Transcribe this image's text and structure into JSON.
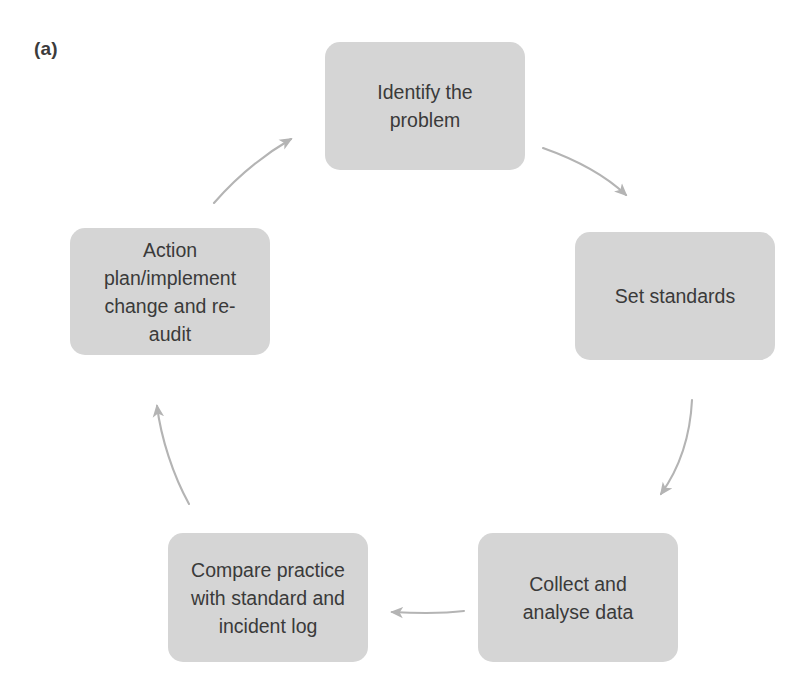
{
  "figure": {
    "panel_label": "(a)",
    "type": "cycle-diagram",
    "box_fill_color": "#d5d5d5",
    "text_color": "#3a3a3a",
    "arrow_color": "#b4b4b4",
    "background_color": "#ffffff"
  },
  "nodes": [
    {
      "id": "identify",
      "label": "Identify the\nproblem",
      "order": 1
    },
    {
      "id": "standards",
      "label": "Set standards",
      "order": 2
    },
    {
      "id": "collect",
      "label": "Collect and\nanalyse data",
      "order": 3
    },
    {
      "id": "compare",
      "label": "Compare practice\nwith standard and\nincident log",
      "order": 4
    },
    {
      "id": "action",
      "label": "Action\nplan/implement\nchange and re-\naudit",
      "order": 5
    }
  ],
  "arrows": [
    {
      "id": "identify-to-standards",
      "from": "identify",
      "to": "standards",
      "direction": "down-right"
    },
    {
      "id": "standards-to-collect",
      "from": "standards",
      "to": "collect",
      "direction": "down-left"
    },
    {
      "id": "collect-to-compare",
      "from": "collect",
      "to": "compare",
      "direction": "left"
    },
    {
      "id": "compare-to-action",
      "from": "compare",
      "to": "action",
      "direction": "up-left"
    },
    {
      "id": "action-to-identify",
      "from": "action",
      "to": "identify",
      "direction": "up-right"
    }
  ]
}
